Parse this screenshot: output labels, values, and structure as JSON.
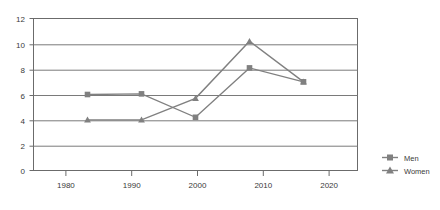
{
  "chart_data": {
    "type": "line",
    "title": "",
    "subtitle": "",
    "xlabel": "",
    "ylabel": "",
    "categories": [
      "1980",
      "1990",
      "2000",
      "2010",
      "2020"
    ],
    "x": [
      1980,
      1990,
      2000,
      2010,
      2020
    ],
    "series": [
      {
        "name": "Men",
        "marker": "square",
        "color": "#808080",
        "values": [
          6.0,
          6.05,
          4.2,
          8.1,
          7.0
        ]
      },
      {
        "name": "Women",
        "marker": "triangle",
        "color": "#808080",
        "values": [
          4.0,
          4.0,
          5.7,
          10.2,
          7.0
        ]
      }
    ],
    "ylim": [
      0,
      12
    ],
    "yticks": [
      0,
      2,
      4,
      6,
      8,
      10,
      12
    ],
    "ytick_labels": [
      "0",
      "2",
      "4",
      "6",
      "8",
      "10",
      "12"
    ],
    "xtick_labels": [
      "1980",
      "1990",
      "2000",
      "2010",
      "2020"
    ],
    "grid": true,
    "grid_axis": "y",
    "legend_position": "right",
    "plot_bg": "#ffffff",
    "frame_color": "#6b6b6b",
    "grid_color": "#7a7a7a"
  },
  "legend": {
    "items": [
      {
        "label": "Men",
        "marker": "square"
      },
      {
        "label": "Women",
        "marker": "triangle"
      }
    ]
  },
  "axis": {
    "y_tick_0": "0",
    "y_tick_1": "2",
    "y_tick_2": "4",
    "y_tick_3": "6",
    "y_tick_4": "8",
    "y_tick_5": "10",
    "y_tick_6": "12",
    "x_tick_0": "1980",
    "x_tick_1": "1990",
    "x_tick_2": "2000",
    "x_tick_3": "2010",
    "x_tick_4": "2020"
  }
}
